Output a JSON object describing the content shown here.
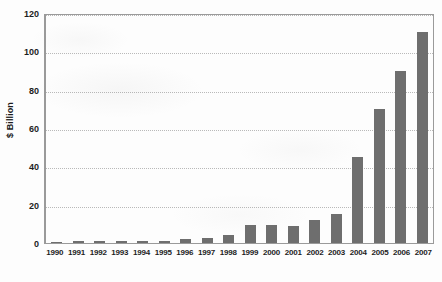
{
  "chart_data": {
    "type": "bar",
    "title": "",
    "xlabel": "",
    "ylabel": "$ Billion",
    "ylim": [
      0,
      120
    ],
    "yticks": [
      0,
      20,
      40,
      60,
      80,
      100,
      120
    ],
    "ytick_labels": [
      "0",
      "20",
      "40",
      "60",
      "80",
      "100",
      "120"
    ],
    "grid": true,
    "legend": "none",
    "bar_color": "#6e6e6e",
    "categories": [
      "1990",
      "1991",
      "1992",
      "1993",
      "1994",
      "1995",
      "1996",
      "1997",
      "1998",
      "1999",
      "2000",
      "2001",
      "2002",
      "2003",
      "2004",
      "2005",
      "2006",
      "2007"
    ],
    "values": [
      0.3,
      0.8,
      1.0,
      1.0,
      1.0,
      1.2,
      2.2,
      2.4,
      4.0,
      9.5,
      9.5,
      9.0,
      12.0,
      15.0,
      45.0,
      70.0,
      90.0,
      110.0
    ],
    "series": [
      {
        "name": "",
        "values": [
          0.3,
          0.8,
          1.0,
          1.0,
          1.0,
          1.2,
          2.2,
          2.4,
          4.0,
          9.5,
          9.5,
          9.0,
          12.0,
          15.0,
          45.0,
          70.0,
          90.0,
          110.0
        ]
      }
    ]
  }
}
